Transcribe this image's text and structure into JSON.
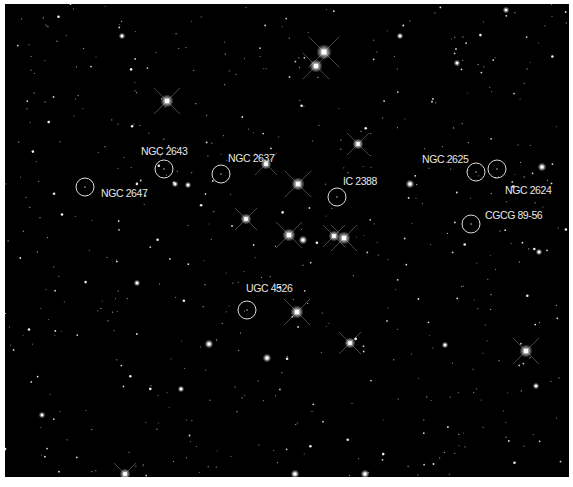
{
  "image": {
    "description": "Deep sky star field (Beehive/Praesepe region) with circled and labeled galaxies",
    "background": "#000000",
    "border_color": "#ffffff"
  },
  "galaxies": [
    {
      "name": "NGC 2647",
      "cx": 85,
      "cy": 187,
      "r": 9,
      "label_x": 101,
      "label_y": 193
    },
    {
      "name": "NGC 2643",
      "cx": 164,
      "cy": 169,
      "r": 9,
      "label_x": 141,
      "label_y": 151
    },
    {
      "name": "NGC 2637",
      "cx": 221,
      "cy": 174,
      "r": 9,
      "label_x": 228,
      "label_y": 158
    },
    {
      "name": "IC 2388",
      "cx": 337,
      "cy": 197,
      "r": 9,
      "label_x": 343,
      "label_y": 181
    },
    {
      "name": "NGC 2625",
      "cx": 476,
      "cy": 172,
      "r": 9,
      "label_x": 422,
      "label_y": 159
    },
    {
      "name": "NGC 2624",
      "cx": 497,
      "cy": 169,
      "r": 9,
      "label_x": 505,
      "label_y": 190
    },
    {
      "name": "CGCG 89-56",
      "cx": 471,
      "cy": 224,
      "r": 9,
      "label_x": 485,
      "label_y": 215
    },
    {
      "name": "UGC 4526",
      "cx": 247,
      "cy": 310,
      "r": 9,
      "label_x": 246,
      "label_y": 288
    }
  ],
  "bright_stars": [
    {
      "x": 324,
      "y": 52,
      "s": 7
    },
    {
      "x": 316,
      "y": 66,
      "s": 6
    },
    {
      "x": 167,
      "y": 101,
      "s": 6
    },
    {
      "x": 358,
      "y": 144,
      "s": 5
    },
    {
      "x": 266,
      "y": 164,
      "s": 5
    },
    {
      "x": 298,
      "y": 184,
      "s": 6
    },
    {
      "x": 246,
      "y": 219,
      "s": 5
    },
    {
      "x": 289,
      "y": 235,
      "s": 6
    },
    {
      "x": 303,
      "y": 240,
      "s": 4
    },
    {
      "x": 334,
      "y": 236,
      "s": 5
    },
    {
      "x": 344,
      "y": 238,
      "s": 6
    },
    {
      "x": 297,
      "y": 312,
      "s": 6
    },
    {
      "x": 350,
      "y": 343,
      "s": 5
    },
    {
      "x": 526,
      "y": 351,
      "s": 6
    },
    {
      "x": 209,
      "y": 344,
      "s": 4
    },
    {
      "x": 267,
      "y": 358,
      "s": 4
    },
    {
      "x": 125,
      "y": 474,
      "s": 5
    },
    {
      "x": 295,
      "y": 474,
      "s": 4
    },
    {
      "x": 365,
      "y": 474,
      "s": 4
    },
    {
      "x": 410,
      "y": 184,
      "s": 4
    },
    {
      "x": 542,
      "y": 167,
      "s": 4
    },
    {
      "x": 188,
      "y": 185,
      "s": 3
    },
    {
      "x": 175,
      "y": 184,
      "s": 3
    },
    {
      "x": 457,
      "y": 63,
      "s": 3
    },
    {
      "x": 506,
      "y": 10,
      "s": 3
    },
    {
      "x": 400,
      "y": 36,
      "s": 3
    },
    {
      "x": 122,
      "y": 36,
      "s": 3
    },
    {
      "x": 42,
      "y": 415,
      "s": 3
    },
    {
      "x": 181,
      "y": 389,
      "s": 3
    },
    {
      "x": 137,
      "y": 283,
      "s": 3
    },
    {
      "x": 539,
      "y": 252,
      "s": 3
    },
    {
      "x": 536,
      "y": 386,
      "s": 3
    },
    {
      "x": 445,
      "y": 345,
      "s": 3
    }
  ],
  "faint_star_seed": 2647,
  "faint_star_count": 520
}
